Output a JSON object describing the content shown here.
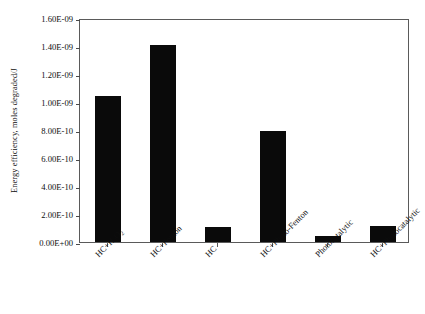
{
  "chart_data": {
    "type": "bar",
    "title": "",
    "xlabel": "",
    "ylabel": "Energy efficiency, moles degraded/J",
    "categories": [
      "HC+H2O2",
      "HC+Fenton",
      "HC",
      "HC+Photo-Fenton",
      "Photocatalytic",
      "HC+Photocatalytic"
    ],
    "category_labels_html": [
      "HC+H<sub>2</sub>O<sub>2</sub>",
      "HC+Fenton",
      "HC",
      "HC+Photo-Fenton",
      "Photocatalytic",
      "HC+Photocatalytic"
    ],
    "values": [
      1.04e-09,
      1.41e-09,
      1.1e-10,
      7.9e-10,
      4.2e-11,
      1.15e-10
    ],
    "ylim": [
      0,
      1.6e-09
    ],
    "ytick_values": [
      0,
      2e-10,
      4e-10,
      6e-10,
      8e-10,
      1e-09,
      1.2e-09,
      1.4e-09,
      1.6e-09
    ],
    "ytick_labels": [
      "0.00E+00",
      "2.00E-10",
      "4.00E-10",
      "6.00E-10",
      "8.00E-10",
      "1.00E-09",
      "1.20E-09",
      "1.40E-09",
      "1.60E-09"
    ],
    "grid": false,
    "legend": false,
    "bar_color": "#0a0a0a",
    "frame_color": "#5a5a5a",
    "background": "#ffffff",
    "xtick_label_rotation": -45
  }
}
